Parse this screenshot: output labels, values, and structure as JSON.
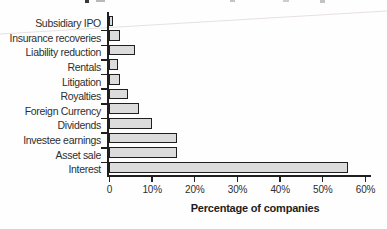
{
  "chart_data": {
    "type": "bar",
    "orientation": "horizontal",
    "categories": [
      "Subsidiary IPO",
      "Insurance recoveries",
      "Liability reduction",
      "Rentals",
      "Litigation",
      "Royalties",
      "Foreign Currency",
      "Dividends",
      "Investee earnings",
      "Asset sale",
      "Interest"
    ],
    "values": [
      1,
      2.5,
      6,
      2,
      2.5,
      4.5,
      7,
      10,
      16,
      16,
      56
    ],
    "title": "",
    "xlabel": "Percentage of companies",
    "ylabel": "",
    "xlim": [
      0,
      60
    ],
    "xticks": [
      0,
      10,
      20,
      30,
      40,
      50,
      60
    ],
    "tick_labels": [
      "0",
      "10%",
      "20%",
      "30%",
      "40%",
      "50%",
      "60%"
    ],
    "grid": false,
    "legend": false,
    "bar_fill_color": "#dcdcdc",
    "bar_border_color": "#1f1f1f",
    "axis_color": "#1f1f1f",
    "text_color": "#2e2e2e"
  }
}
